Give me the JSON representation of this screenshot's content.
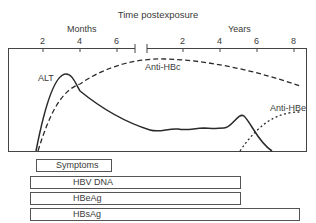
{
  "title": "Time postexposure",
  "axis": {
    "months_label": "Months",
    "years_label": "Years",
    "month_ticks": [
      "2",
      "4",
      "6"
    ],
    "year_ticks": [
      "2",
      "4",
      "6",
      "8"
    ]
  },
  "curves": {
    "alt": "ALT",
    "anti_hbc": "Anti-HBc",
    "anti_hbe": "Anti-HBe"
  },
  "bars": [
    {
      "label": "Symptoms"
    },
    {
      "label": "HBV DNA"
    },
    {
      "label": "HBeAg"
    },
    {
      "label": "HBsAg"
    }
  ],
  "colors": {
    "line": "#333333",
    "text": "#3a3a3a",
    "background": "#ffffff"
  }
}
